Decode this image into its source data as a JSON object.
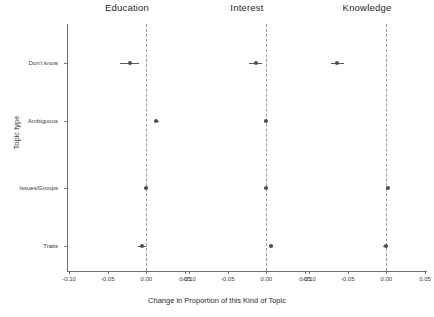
{
  "chart_data": {
    "type": "scatter",
    "title": "",
    "xlabel": "Change in Proportion of this Kind of Topic",
    "ylabel": "Topic type",
    "xlim": [
      -0.1,
      0.05
    ],
    "xticks": [
      -0.1,
      -0.05,
      0.0,
      0.05
    ],
    "xtick_labels": [
      "-0.10",
      "-0.05",
      "0.00",
      "0.05"
    ],
    "categories": [
      "Don't know",
      "Ambiguous",
      "Issues/Groups",
      "Traits"
    ],
    "grid": false,
    "legend": "none",
    "reference_line": 0.0,
    "reference_line_style": "dashed",
    "panel_titles": [
      "Education",
      "Interest",
      "Knowledge"
    ],
    "marker_color": "#4d4d4d",
    "errorbar_color": "#5a5a5a",
    "panels": [
      {
        "name": "Education",
        "points": [
          {
            "category": "Don't know",
            "estimate": -0.0215,
            "low": -0.034,
            "high": -0.0095
          },
          {
            "category": "Ambiguous",
            "estimate": 0.013,
            "low": 0.0095,
            "high": 0.0165
          },
          {
            "category": "Issues/Groups",
            "estimate": -0.0005,
            "low": -0.003,
            "high": 0.002
          },
          {
            "category": "Traits",
            "estimate": -0.0055,
            "low": -0.0105,
            "high": -0.0005
          }
        ]
      },
      {
        "name": "Interest",
        "points": [
          {
            "category": "Don't know",
            "estimate": -0.014,
            "low": -0.023,
            "high": -0.0055
          },
          {
            "category": "Ambiguous",
            "estimate": -0.001,
            "low": -0.0035,
            "high": 0.0015
          },
          {
            "category": "Issues/Groups",
            "estimate": -0.001,
            "low": -0.003,
            "high": 0.001
          },
          {
            "category": "Traits",
            "estimate": 0.0055,
            "low": 0.003,
            "high": 0.008
          }
        ]
      },
      {
        "name": "Knowledge",
        "points": [
          {
            "category": "Don't know",
            "estimate": -0.0635,
            "low": -0.072,
            "high": -0.0545
          },
          {
            "category": "Issues/Groups",
            "estimate": 0.002,
            "low": 0.0,
            "high": 0.004
          },
          {
            "category": "Traits",
            "estimate": -0.001,
            "low": -0.0045,
            "high": 0.0025
          }
        ]
      }
    ]
  }
}
